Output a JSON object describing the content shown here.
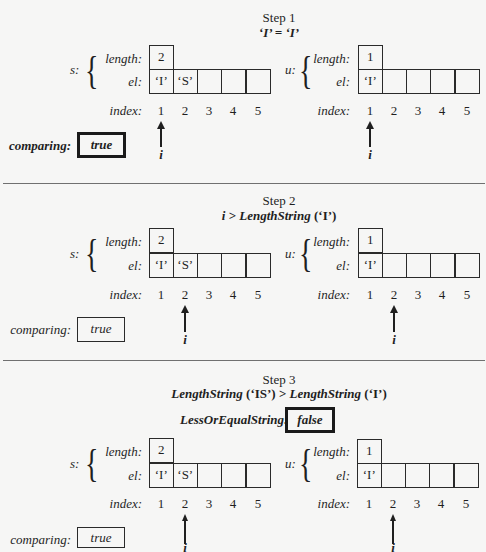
{
  "steps": [
    {
      "title": "Step 1",
      "condition": "‘I’ = ‘I’",
      "s": {
        "name": "s:",
        "length_label": "length:",
        "el_label": "el:",
        "index_label": "index:",
        "length": "2",
        "el": [
          "‘I’",
          "‘S’",
          "",
          "",
          ""
        ]
      },
      "u": {
        "name": "u:",
        "length_label": "length:",
        "el_label": "el:",
        "index_label": "index:",
        "length": "1",
        "el": [
          "‘I’",
          "",
          "",
          "",
          ""
        ]
      },
      "indices": [
        "1",
        "2",
        "3",
        "4",
        "5"
      ],
      "pointer": {
        "label": "i",
        "position": 1
      },
      "comparing": {
        "label": "comparing:",
        "value": "true",
        "emphasized": true
      }
    },
    {
      "title": "Step 2",
      "condition_parts": {
        "var": "i",
        "op": " > ",
        "fn": "LengthString",
        "arg": " (‘I’)"
      },
      "s": {
        "name": "s:",
        "length_label": "length:",
        "el_label": "el:",
        "index_label": "index:",
        "length": "2",
        "el": [
          "‘I’",
          "‘S’",
          "",
          "",
          ""
        ]
      },
      "u": {
        "name": "u:",
        "length_label": "length:",
        "el_label": "el:",
        "index_label": "index:",
        "length": "1",
        "el": [
          "‘I’",
          "",
          "",
          "",
          ""
        ]
      },
      "indices": [
        "1",
        "2",
        "3",
        "4",
        "5"
      ],
      "pointer": {
        "label": "i",
        "position": 2
      },
      "comparing": {
        "label": "comparing:",
        "value": "true",
        "emphasized": false
      }
    },
    {
      "title": "Step 3",
      "condition_parts": {
        "fn1": "LengthString",
        "arg1": " (‘IS’) > ",
        "fn2": "LengthString",
        "arg2": " (‘I’)"
      },
      "result": {
        "label": "LessOrEqualString:",
        "value": "false"
      },
      "s": {
        "name": "s:",
        "length_label": "length:",
        "el_label": "el:",
        "index_label": "index:",
        "length": "2",
        "el": [
          "‘I’",
          "‘S’",
          "",
          "",
          ""
        ]
      },
      "u": {
        "name": "u:",
        "length_label": "length:",
        "el_label": "el:",
        "index_label": "index:",
        "length": "1",
        "el": [
          "‘I’",
          "",
          "",
          "",
          ""
        ]
      },
      "indices": [
        "1",
        "2",
        "3",
        "4",
        "5"
      ],
      "pointer": {
        "label": "i",
        "position": 2
      },
      "comparing": {
        "label": "comparing:",
        "value": "true",
        "emphasized": false
      }
    }
  ],
  "colors": {
    "background": "#f6f6f5",
    "ink": "#1f1f1f",
    "divider": "#707070"
  }
}
